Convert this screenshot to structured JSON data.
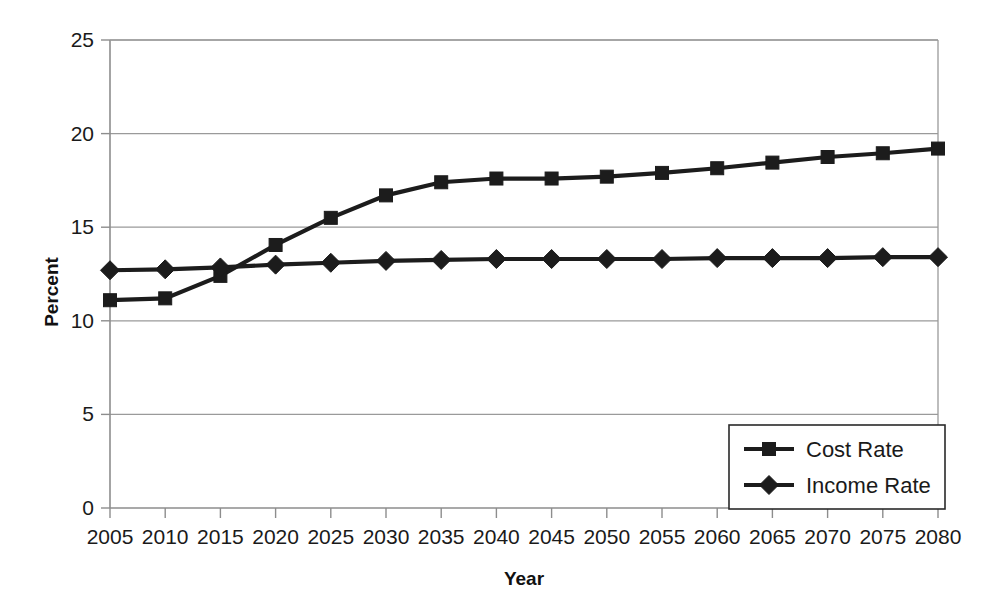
{
  "chart_data": {
    "type": "line",
    "title": "",
    "xlabel": "Year",
    "ylabel": "Percent",
    "categories": [
      2005,
      2010,
      2015,
      2020,
      2025,
      2030,
      2035,
      2040,
      2045,
      2050,
      2055,
      2060,
      2065,
      2070,
      2075,
      2080
    ],
    "x_tick_labels": [
      "2005",
      "2010",
      "2015",
      "2020",
      "2025",
      "2030",
      "2035",
      "2040",
      "2045",
      "2050",
      "2055",
      "2060",
      "2065",
      "2070",
      "2075",
      "2080"
    ],
    "y_tick_labels": [
      "0",
      "5",
      "10",
      "15",
      "20",
      "25"
    ],
    "y_ticks": [
      0,
      5,
      10,
      15,
      20,
      25
    ],
    "ylim": [
      0,
      25
    ],
    "xlim": [
      2005,
      2080
    ],
    "grid": true,
    "legend_position": "bottom-right",
    "series": [
      {
        "name": "Cost Rate",
        "marker": "square",
        "color": "#1c1c1c",
        "values": [
          11.1,
          11.2,
          12.4,
          14.05,
          15.5,
          16.7,
          17.4,
          17.6,
          17.6,
          17.7,
          17.9,
          18.15,
          18.45,
          18.75,
          18.95,
          19.2
        ]
      },
      {
        "name": "Income Rate",
        "marker": "diamond",
        "color": "#1c1c1c",
        "values": [
          12.7,
          12.75,
          12.85,
          13.0,
          13.1,
          13.2,
          13.25,
          13.3,
          13.3,
          13.3,
          13.3,
          13.35,
          13.35,
          13.35,
          13.4,
          13.4
        ]
      }
    ],
    "annotations": []
  },
  "legend": {
    "entries": [
      {
        "label": "Cost Rate",
        "marker": "square"
      },
      {
        "label": "Income Rate",
        "marker": "diamond"
      }
    ]
  },
  "axes": {
    "x_title": "Year",
    "y_title": "Percent"
  },
  "colors": {
    "series": "#1c1c1c",
    "grid": "#9a9a9a",
    "background": "#ffffff",
    "text": "#1a1a1a"
  }
}
